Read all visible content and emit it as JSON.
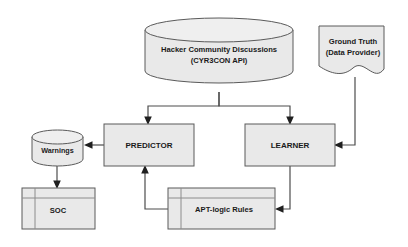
{
  "diagram": {
    "colors": {
      "shape_fill": "#e9e9e9",
      "shape_fill_top": "#efefef",
      "shape_stroke": "#5a5a5a",
      "inner_line": "#8c8c8c",
      "connector": "#4d4d4d",
      "arrow": "#1f1f1f",
      "text": "#1a1a1a",
      "background": "#ffffff"
    },
    "nodes": [
      {
        "id": "hacker-community-discussions",
        "shape": "cylinder",
        "lines": [
          "Hacker Community Discussions",
          "(CYR3CON API)"
        ],
        "x": 145,
        "y": 18,
        "width": 148,
        "height": 65
      },
      {
        "id": "ground-truth",
        "shape": "document",
        "lines": [
          "Ground Truth",
          "(Data Provider)"
        ],
        "x": 319,
        "y": 26,
        "width": 72,
        "height": 51
      },
      {
        "id": "predictor",
        "shape": "rectangle",
        "lines": [
          "PREDICTOR"
        ],
        "x": 104,
        "y": 124,
        "width": 90,
        "height": 42
      },
      {
        "id": "learner",
        "shape": "rectangle",
        "lines": [
          "LEARNER"
        ],
        "x": 245,
        "y": 124,
        "width": 90,
        "height": 42
      },
      {
        "id": "warnings",
        "shape": "cylinder",
        "lines": [
          "Warnings"
        ],
        "x": 32,
        "y": 130,
        "width": 51,
        "height": 36
      },
      {
        "id": "soc",
        "shape": "module",
        "lines": [
          "SOC"
        ],
        "x": 22,
        "y": 188,
        "width": 73,
        "height": 41
      },
      {
        "id": "apt-logic-rules",
        "shape": "module",
        "lines": [
          "APT-logic Rules"
        ],
        "x": 168,
        "y": 188,
        "width": 107,
        "height": 41
      }
    ],
    "edges": [
      {
        "id": "discussions-to-predictor",
        "from": "hacker-community-discussions",
        "to": "predictor",
        "arrow": "down"
      },
      {
        "id": "discussions-to-learner",
        "from": "hacker-community-discussions",
        "to": "learner",
        "arrow": "down"
      },
      {
        "id": "ground-truth-to-learner",
        "from": "ground-truth",
        "to": "learner",
        "arrow": "left"
      },
      {
        "id": "predictor-to-warnings",
        "from": "predictor",
        "to": "warnings",
        "arrow": "left"
      },
      {
        "id": "warnings-to-soc",
        "from": "warnings",
        "to": "soc",
        "arrow": "down"
      },
      {
        "id": "learner-to-apt-logic-rules",
        "from": "learner",
        "to": "apt-logic-rules",
        "arrow": "left"
      },
      {
        "id": "apt-logic-rules-to-predictor",
        "from": "apt-logic-rules",
        "to": "predictor",
        "arrow": "up"
      }
    ]
  }
}
